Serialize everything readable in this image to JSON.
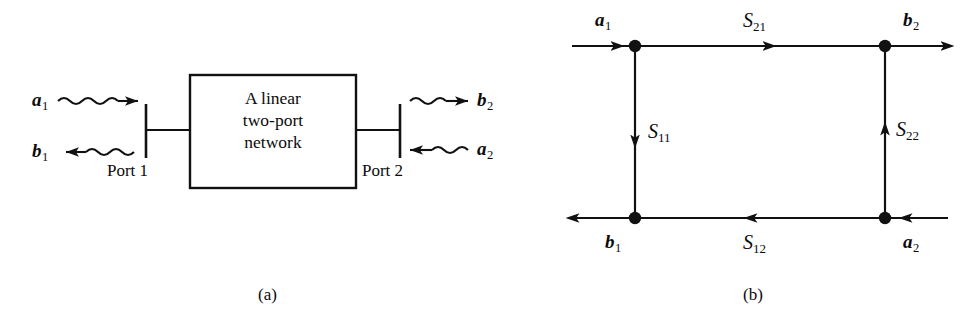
{
  "figure": {
    "type": "two-port-network-s-parameter-figure",
    "background_color": "#ffffff",
    "line_color": "#111111",
    "panels": [
      {
        "id": "a",
        "caption": "(a)",
        "title": "Two-port network block diagram",
        "block_label_lines": [
          "A linear",
          "two-port",
          "network"
        ],
        "port_labels": [
          "Port 1",
          "Port 2"
        ],
        "waves": [
          {
            "name": "a1",
            "label": "a",
            "subscript": "1",
            "direction": "right",
            "side": "left",
            "meaning": "incident wave at port 1"
          },
          {
            "name": "b1",
            "label": "b",
            "subscript": "1",
            "direction": "left",
            "side": "left",
            "meaning": "reflected wave at port 1"
          },
          {
            "name": "b2",
            "label": "b",
            "subscript": "2",
            "direction": "right",
            "side": "right",
            "meaning": "emerging wave at port 2"
          },
          {
            "name": "a2",
            "label": "a",
            "subscript": "2",
            "direction": "left",
            "side": "right",
            "meaning": "incident wave at port 2"
          }
        ]
      },
      {
        "id": "b",
        "caption": "(b)",
        "title": "Signal flow graph",
        "nodes": [
          {
            "name": "a1",
            "label": "a",
            "subscript": "1",
            "position": "top-left"
          },
          {
            "name": "b2",
            "label": "b",
            "subscript": "2",
            "position": "top-right"
          },
          {
            "name": "b1",
            "label": "b",
            "subscript": "1",
            "position": "bottom-left"
          },
          {
            "name": "a2",
            "label": "a",
            "subscript": "2",
            "position": "bottom-right"
          }
        ],
        "branches": [
          {
            "name": "S21",
            "label": "S",
            "subscript": "21",
            "from": "a1",
            "to": "b2",
            "direction": "right",
            "edge": "top"
          },
          {
            "name": "S11",
            "label": "S",
            "subscript": "11",
            "from": "a1",
            "to": "b1",
            "direction": "down",
            "edge": "left"
          },
          {
            "name": "S22",
            "label": "S",
            "subscript": "22",
            "from": "a2",
            "to": "b2",
            "direction": "up",
            "edge": "right"
          },
          {
            "name": "S12",
            "label": "S",
            "subscript": "12",
            "from": "a2",
            "to": "b1",
            "direction": "left",
            "edge": "bottom"
          }
        ]
      }
    ]
  }
}
